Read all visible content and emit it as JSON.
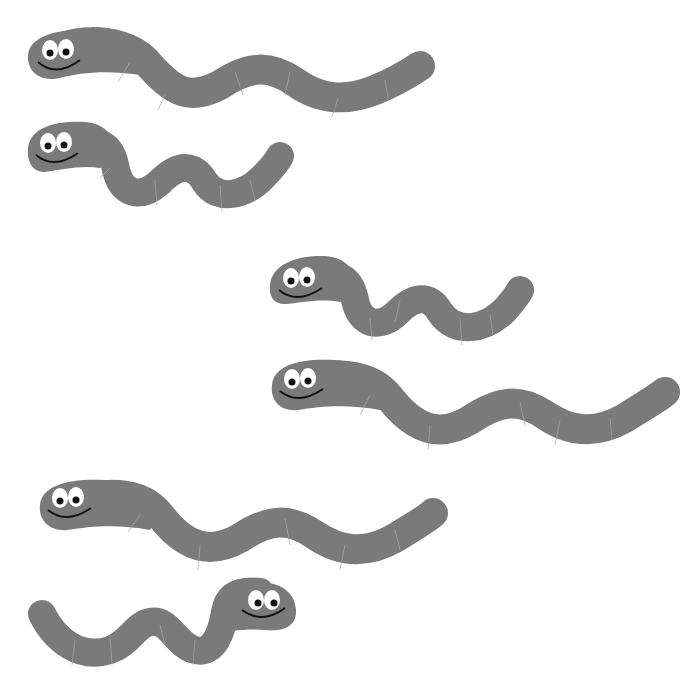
{
  "scene": {
    "description": "Six cartoon worms",
    "background": "#ffffff",
    "worm_color": "#7a7a7a",
    "segment_color": "#a8a8a8",
    "eye_white": "#ffffff",
    "pupil_color": "#111111",
    "smile_color": "#111111"
  },
  "worms": [
    {
      "id": 1,
      "facing": "left",
      "size": "long"
    },
    {
      "id": 2,
      "facing": "left",
      "size": "short"
    },
    {
      "id": 3,
      "facing": "left",
      "size": "short"
    },
    {
      "id": 4,
      "facing": "left",
      "size": "long"
    },
    {
      "id": 5,
      "facing": "left",
      "size": "long"
    },
    {
      "id": 6,
      "facing": "right",
      "size": "short"
    }
  ]
}
